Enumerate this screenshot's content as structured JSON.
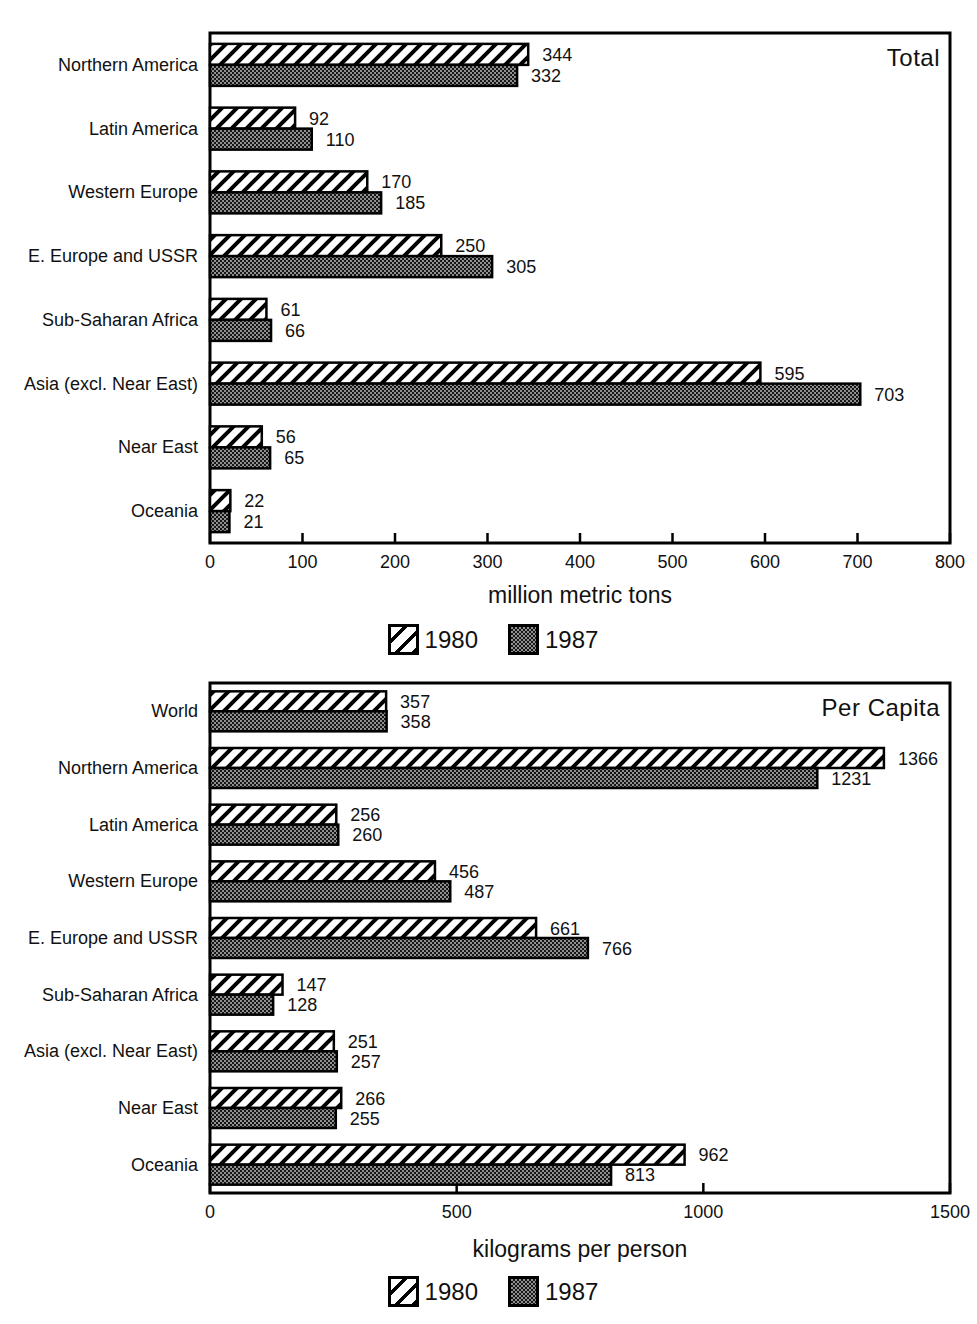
{
  "page": {
    "background": "#ffffff"
  },
  "colors": {
    "ink": "#111111",
    "bar_outline": "#000000",
    "hatch_bg": "#ffffff",
    "hatch_line": "#000000",
    "checker_dark": "#161616",
    "checker_light": "#909090"
  },
  "legend": {
    "items": [
      {
        "label": "1980",
        "pattern": "hatch"
      },
      {
        "label": "1987",
        "pattern": "checker"
      }
    ]
  },
  "chart_data": [
    {
      "id": "total",
      "type": "bar",
      "orientation": "horizontal",
      "title": "Total",
      "xlabel": "million metric tons",
      "xlim": [
        0,
        800
      ],
      "xticks": [
        0,
        100,
        200,
        300,
        400,
        500,
        600,
        700,
        800
      ],
      "grid": "off",
      "legend_position": "bottom",
      "value_labels": "end-of-bar",
      "categories": [
        "Northern America",
        "Latin America",
        "Western Europe",
        "E. Europe and USSR",
        "Sub-Saharan Africa",
        "Asia (excl. Near East)",
        "Near East",
        "Oceania"
      ],
      "series": [
        {
          "name": "1980",
          "pattern": "hatch",
          "values": [
            344,
            92,
            170,
            250,
            61,
            595,
            56,
            22
          ]
        },
        {
          "name": "1987",
          "pattern": "checker",
          "values": [
            332,
            110,
            185,
            305,
            66,
            703,
            65,
            21
          ]
        }
      ]
    },
    {
      "id": "per-capita",
      "type": "bar",
      "orientation": "horizontal",
      "title": "Per Capita",
      "xlabel": "kilograms per person",
      "xlim": [
        0,
        1500
      ],
      "xticks": [
        0,
        500,
        1000,
        1500
      ],
      "grid": "off",
      "legend_position": "bottom",
      "value_labels": "end-of-bar",
      "categories": [
        "World",
        "Northern America",
        "Latin America",
        "Western Europe",
        "E. Europe and USSR",
        "Sub-Saharan Africa",
        "Asia (excl. Near East)",
        "Near East",
        "Oceania"
      ],
      "series": [
        {
          "name": "1980",
          "pattern": "hatch",
          "values": [
            357,
            1366,
            256,
            456,
            661,
            147,
            251,
            266,
            962
          ]
        },
        {
          "name": "1987",
          "pattern": "checker",
          "values": [
            358,
            1231,
            260,
            487,
            766,
            128,
            257,
            255,
            813
          ]
        }
      ]
    }
  ]
}
